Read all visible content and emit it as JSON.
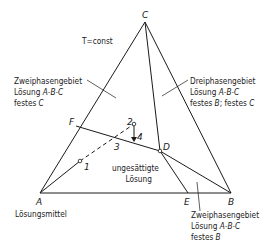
{
  "diagram": {
    "type": "ternary-phase-diagram",
    "condition": "T=const",
    "vertices": {
      "A": {
        "label": "A",
        "caption": "Lösungsmittel"
      },
      "B": {
        "label": "B"
      },
      "C": {
        "label": "C"
      }
    },
    "points": {
      "D": "D",
      "E": "E",
      "F": "F",
      "p1": "1",
      "p2": "2",
      "p3": "3",
      "p4": "4"
    },
    "regions": {
      "two_phase_c": {
        "line1": "Zweiphasengebiet",
        "line2_prefix": "Lösung ",
        "line2_it": "A-B-C",
        "line3_prefix": "festes ",
        "line3_it": "C"
      },
      "three_phase": {
        "line1": "Dreiphasengebiet",
        "line2_prefix": "Lösung ",
        "line2_it": "A-B-C",
        "line3_prefix": "festes ",
        "line3_it": "B",
        "line3_mid": "; festes ",
        "line3_it2": "C"
      },
      "unsaturated": {
        "line1": "ungesättigte",
        "line2": "Lösung"
      },
      "two_phase_b": {
        "line1": "Zweiphasengebiet",
        "line2_prefix": "Lösung ",
        "line2_it": "A-B-C",
        "line3_prefix": "festes ",
        "line3_it": "B"
      }
    },
    "colors": {
      "line": "#1a1a1a",
      "background": "#ffffff"
    }
  }
}
